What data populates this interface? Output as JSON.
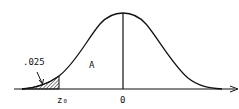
{
  "figure": {
    "type": "normal-distribution-curve",
    "tail_area_label": ".025",
    "region_label": "A",
    "critical_value_label": "z₀",
    "mean_label": "0",
    "colors": {
      "stroke": "#111111",
      "background": "#ffffff",
      "hatch": "#111111"
    }
  }
}
